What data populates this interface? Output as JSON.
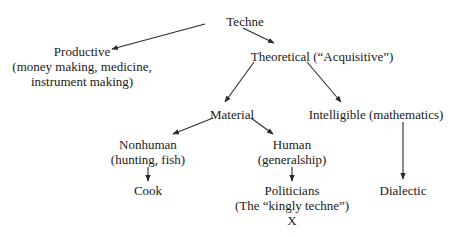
{
  "diagram": {
    "type": "tree",
    "nodes": {
      "techne": {
        "label": "Techne"
      },
      "productive": {
        "label": "Productive",
        "detail1": "(money making, medicine,",
        "detail2": "instrument making)"
      },
      "theoretical": {
        "label": "Theoretical (“Acquisitive”)"
      },
      "material": {
        "label": "Material"
      },
      "intelligible": {
        "label": "Intelligible (mathematics)"
      },
      "nonhuman": {
        "label": "Nonhuman",
        "detail1": "(hunting, fish)"
      },
      "human": {
        "label": "Human",
        "detail1": "(generalship)"
      },
      "cook": {
        "label": "Cook"
      },
      "politicians": {
        "label": "Politicians",
        "detail1": "(The “kingly techne”)",
        "detail2": "X"
      },
      "dialectic": {
        "label": "Dialectic"
      }
    },
    "edges": [
      {
        "from": "techne",
        "to": "productive"
      },
      {
        "from": "techne",
        "to": "theoretical"
      },
      {
        "from": "theoretical",
        "to": "material"
      },
      {
        "from": "theoretical",
        "to": "intelligible"
      },
      {
        "from": "material",
        "to": "nonhuman"
      },
      {
        "from": "material",
        "to": "human"
      },
      {
        "from": "nonhuman",
        "to": "cook"
      },
      {
        "from": "human",
        "to": "politicians"
      },
      {
        "from": "intelligible",
        "to": "dialectic"
      }
    ],
    "colors": {
      "text": "#1a1a1a",
      "arrow": "#2a2a2a",
      "background": "#ffffff"
    }
  }
}
